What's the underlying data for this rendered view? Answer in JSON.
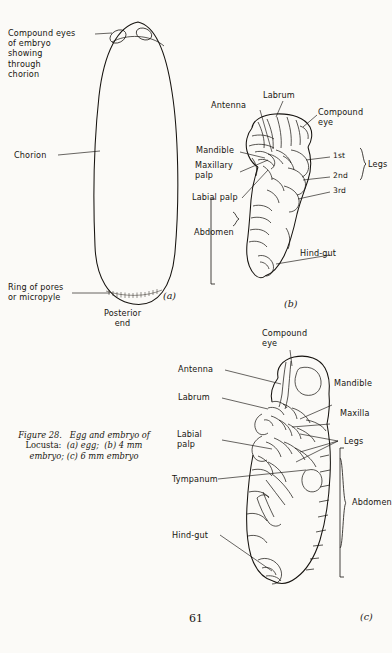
{
  "page": {
    "folio": "61",
    "background_color": "#fbfaf7",
    "ink_color": "#16130f"
  },
  "caption": {
    "figure_number": "Figure 28.",
    "title": "Egg and embryo of",
    "line2": "Locusta:",
    "item_a": "(a) egg;",
    "item_b": "(b) 4 mm",
    "line3": "embryo; (c) 6 mm embryo"
  },
  "panel_a": {
    "tag": "(a)",
    "labels": {
      "compound_eyes": "Compound eyes\nof embryo\nshowing\nthrough\nchorion",
      "chorion": "Chorion",
      "micropyle": "Ring of pores\nor micropyle",
      "posterior_end": "Posterior\nend"
    }
  },
  "panel_b": {
    "tag": "(b)",
    "labels": {
      "labrum": "Labrum",
      "antenna": "Antenna",
      "compound_eye": "Compound\neye",
      "mandible": "Mandible",
      "maxillary_palp": "Maxillary\npalp",
      "labial_palp": "Labial palp",
      "abdomen": "Abdomen",
      "hind_gut": "Hind-gut",
      "leg_1": "1st",
      "leg_2": "2nd",
      "leg_3": "3rd",
      "legs": "Legs"
    }
  },
  "panel_c": {
    "tag": "(c)",
    "labels": {
      "compound_eye": "Compound\neye",
      "antenna": "Antenna",
      "labrum": "Labrum",
      "mandible": "Mandible",
      "maxilla": "Maxilla",
      "labial_palp": "Labial\npalp",
      "legs": "Legs",
      "tympanum": "Tympanum",
      "abdomen": "Abdomen",
      "hind_gut": "Hind-gut"
    }
  }
}
